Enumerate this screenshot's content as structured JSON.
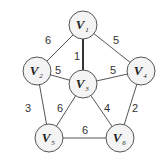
{
  "graph": {
    "nodes": [
      {
        "id": "V1",
        "label": "V",
        "sub": "1",
        "x": 83,
        "y": 25
      },
      {
        "id": "V2",
        "label": "V",
        "sub": "2",
        "x": 37,
        "y": 71
      },
      {
        "id": "V3",
        "label": "V",
        "sub": "3",
        "x": 83,
        "y": 84
      },
      {
        "id": "V4",
        "label": "V",
        "sub": "4",
        "x": 141,
        "y": 71
      },
      {
        "id": "V5",
        "label": "V",
        "sub": "5",
        "x": 49,
        "y": 138
      },
      {
        "id": "V6",
        "label": "V",
        "sub": "6",
        "x": 120,
        "y": 138
      }
    ],
    "edges": [
      {
        "from": "V1",
        "to": "V2",
        "weight": "6",
        "lx": 48,
        "ly": 44
      },
      {
        "from": "V1",
        "to": "V4",
        "weight": "5",
        "lx": 116,
        "ly": 44
      },
      {
        "from": "V1",
        "to": "V3",
        "weight": "1",
        "lx": 77,
        "ly": 60
      },
      {
        "from": "V2",
        "to": "V3",
        "weight": "5",
        "lx": 58,
        "ly": 74
      },
      {
        "from": "V4",
        "to": "V3",
        "weight": "5",
        "lx": 113,
        "ly": 74
      },
      {
        "from": "V2",
        "to": "V5",
        "weight": "3",
        "lx": 28,
        "ly": 112
      },
      {
        "from": "V3",
        "to": "V5",
        "weight": "6",
        "lx": 60,
        "ly": 112
      },
      {
        "from": "V3",
        "to": "V6",
        "weight": "4",
        "lx": 107,
        "ly": 112
      },
      {
        "from": "V4",
        "to": "V6",
        "weight": "2",
        "lx": 135,
        "ly": 112
      },
      {
        "from": "V5",
        "to": "V6",
        "weight": "6",
        "lx": 85,
        "ly": 134
      }
    ]
  }
}
